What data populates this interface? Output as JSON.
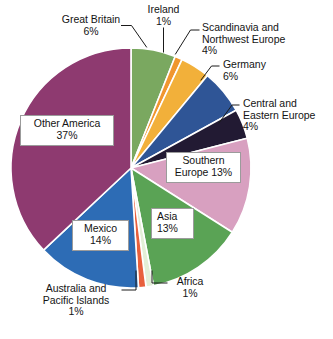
{
  "chart_data": {
    "type": "pie",
    "title": "",
    "subtitle": "",
    "xlabel": "",
    "ylabel": "",
    "legend_position": "none",
    "grid": false,
    "units": "percent",
    "total": 100,
    "start_angle_deg": 0,
    "direction": "clockwise",
    "categories": [
      "Great Britain",
      "Ireland",
      "Scandinavia and Northwest Europe",
      "Germany",
      "Central and Eastern Europe",
      "Southern Europe",
      "Asia",
      "Africa",
      "Australia and Pacific Islands",
      "Mexico",
      "Other America"
    ],
    "values": [
      6,
      1,
      4,
      6,
      4,
      13,
      13,
      1,
      1,
      14,
      37
    ],
    "colors": [
      "#7aa860",
      "#f0962f",
      "#f2b03a",
      "#2f5596",
      "#221a33",
      "#d8a0c0",
      "#5aa355",
      "#e3efd7",
      "#e8603c",
      "#2d6cb5",
      "#8e3a70"
    ],
    "slice_separator_color": "#ffffff"
  },
  "slices": [
    {
      "name": "Great Britain",
      "label_text": "Great Britain\n6%",
      "percent_text": "6%",
      "value": 6,
      "color": "#7aa860",
      "label_style": "callout",
      "has_leader_line": true
    },
    {
      "name": "Ireland",
      "label_text": "Ireland\n1%",
      "percent_text": "1%",
      "value": 1,
      "color": "#f0962f",
      "label_style": "callout",
      "has_leader_line": true
    },
    {
      "name": "Scandinavia and Northwest Europe",
      "label_text": "Scandinavia and\nNorthwest Europe\n4%",
      "percent_text": "4%",
      "value": 4,
      "color": "#f2b03a",
      "label_style": "callout",
      "has_leader_line": true
    },
    {
      "name": "Germany",
      "label_text": "Germany\n6%",
      "percent_text": "6%",
      "value": 6,
      "color": "#2f5596",
      "label_style": "callout",
      "has_leader_line": true
    },
    {
      "name": "Central and Eastern Europe",
      "label_text": "Central and\nEastern Europe\n4%",
      "percent_text": "4%",
      "value": 4,
      "color": "#221a33",
      "label_style": "callout",
      "has_leader_line": true
    },
    {
      "name": "Southern Europe",
      "label_text": "Southern\nEurope 13%",
      "percent_text": "13%",
      "value": 13,
      "color": "#d8a0c0",
      "label_style": "boxed-inside",
      "has_leader_line": false
    },
    {
      "name": "Asia",
      "label_text": "Asia\n13%",
      "percent_text": "13%",
      "value": 13,
      "color": "#5aa355",
      "label_style": "boxed-inside",
      "has_leader_line": false
    },
    {
      "name": "Africa",
      "label_text": "Africa\n1%",
      "percent_text": "1%",
      "value": 1,
      "color": "#e3efd7",
      "label_style": "callout",
      "has_leader_line": true
    },
    {
      "name": "Australia and Pacific Islands",
      "label_text": "Australia and\nPacific Islands\n1%",
      "percent_text": "1%",
      "value": 1,
      "color": "#e8603c",
      "label_style": "callout",
      "has_leader_line": true
    },
    {
      "name": "Mexico",
      "label_text": "Mexico\n14%",
      "percent_text": "14%",
      "value": 14,
      "color": "#2d6cb5",
      "label_style": "boxed-inside",
      "has_leader_line": false
    },
    {
      "name": "Other America",
      "label_text": "Other America\n37%",
      "percent_text": "37%",
      "value": 37,
      "color": "#8e3a70",
      "label_style": "boxed-inside",
      "has_leader_line": false
    }
  ]
}
